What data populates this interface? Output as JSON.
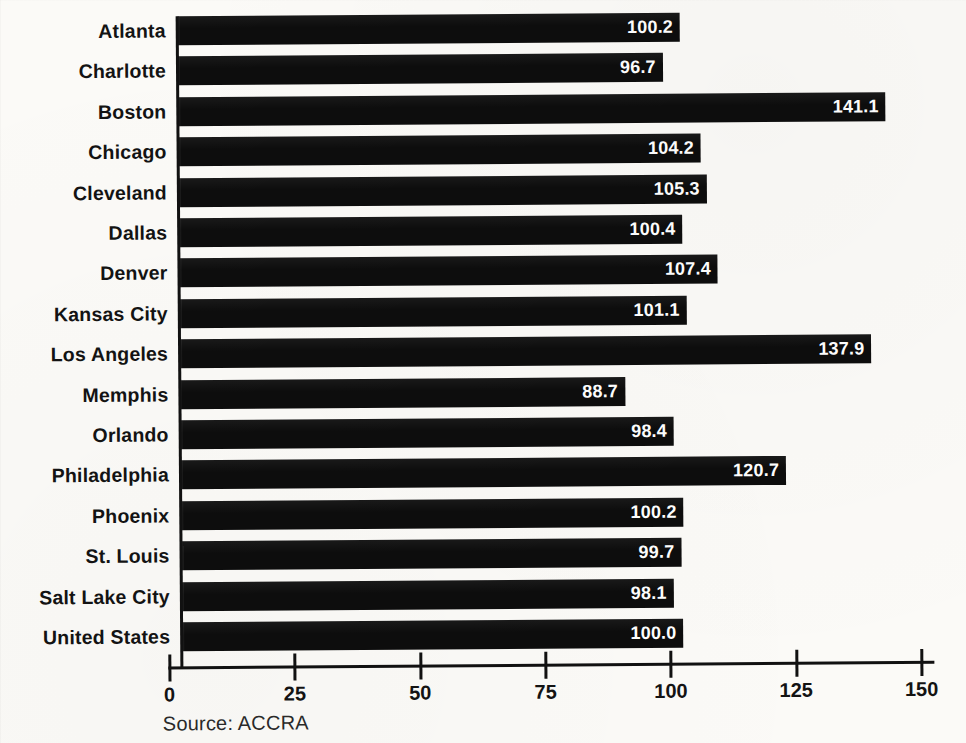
{
  "chart_data": {
    "type": "bar",
    "orientation": "horizontal",
    "title": "",
    "xlabel": "",
    "ylabel": "",
    "xlim": [
      0,
      150
    ],
    "xticks": [
      0,
      25,
      50,
      75,
      100,
      125,
      150
    ],
    "xtick_labels": [
      "0",
      "25",
      "50",
      "75",
      "100",
      "125",
      "150"
    ],
    "grid": false,
    "legend": false,
    "source_note": "Source: ACCRA",
    "bar_color": "#0d0d0d",
    "value_label_color": "#ffffff",
    "background_color": "#fbfaf7",
    "categories": [
      "Atlanta",
      "Charlotte",
      "Boston",
      "Chicago",
      "Cleveland",
      "Dallas",
      "Denver",
      "Kansas City",
      "Los Angeles",
      "Memphis",
      "Orlando",
      "Philadelphia",
      "Phoenix",
      "St. Louis",
      "Salt Lake City",
      "United States"
    ],
    "values": [
      100.2,
      96.7,
      141.1,
      104.2,
      105.3,
      100.4,
      107.4,
      101.1,
      137.9,
      88.7,
      98.4,
      120.7,
      100.2,
      99.7,
      98.1,
      100.0
    ],
    "value_labels": [
      "100.2",
      "96.7",
      "141.1",
      "104.2",
      "105.3",
      "100.4",
      "107.4",
      "101.1",
      "137.9",
      "88.7",
      "98.4",
      "120.7",
      "100.2",
      "99.7",
      "98.1",
      "100.0"
    ]
  }
}
